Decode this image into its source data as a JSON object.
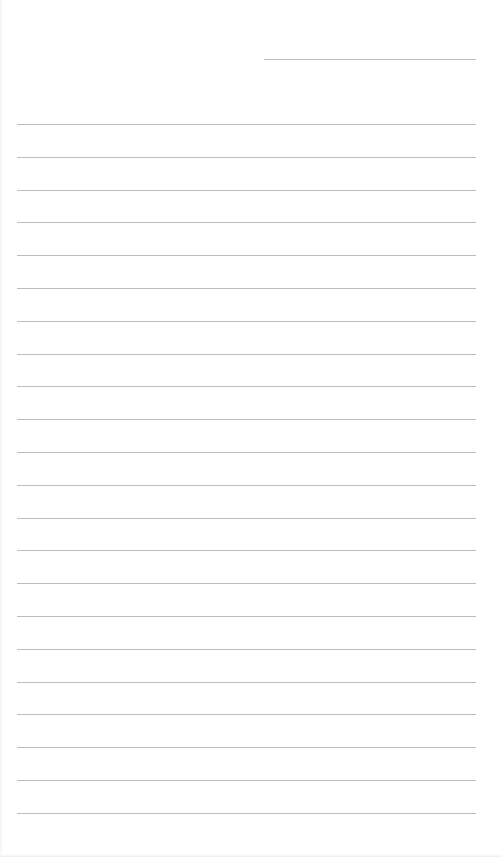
{
  "document": {
    "type": "lined-paper",
    "background_color": "#ffffff",
    "line_color": "#bdbdbd",
    "header_line": {
      "x1": 264,
      "x2": 476,
      "y": 59
    },
    "ruled_lines": {
      "count": 22,
      "x1": 17,
      "x2": 476,
      "first_y": 124,
      "spacing": 32.8
    }
  }
}
